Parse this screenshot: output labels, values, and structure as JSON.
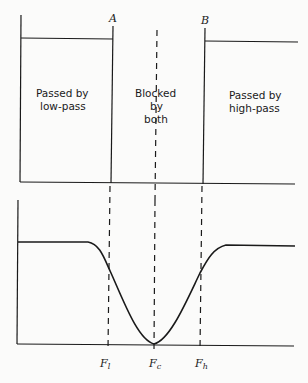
{
  "top_diagram": {
    "markers": {
      "a": "A",
      "b": "B"
    },
    "regions": {
      "low_pass": [
        "Passed by",
        "low-pass"
      ],
      "blocked": [
        "Blocked",
        "by",
        "both"
      ],
      "high_pass": [
        "Passed by",
        "high-pass"
      ]
    }
  },
  "bottom_diagram": {
    "freq_labels": {
      "low": {
        "main": "F",
        "sub": "l"
      },
      "center": {
        "main": "F",
        "sub": "c"
      },
      "high": {
        "main": "F",
        "sub": "h"
      }
    }
  },
  "colors": {
    "line": "#1a1a1a",
    "background": "#fbfbfa"
  }
}
